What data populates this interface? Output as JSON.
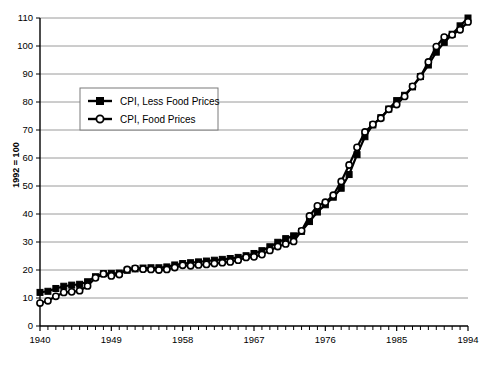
{
  "chart_data": {
    "type": "line",
    "title": "",
    "subtitle": "",
    "xlabel": "",
    "ylabel": "1992 = 100",
    "xlim": [
      1940,
      1994
    ],
    "ylim": [
      0,
      110
    ],
    "ytick_step": 10,
    "grid": true,
    "grid_axis": "y",
    "legend_position": "upper-left-inside",
    "xticks_major": [
      "1940",
      "1949",
      "1958",
      "1967",
      "1976",
      "1985",
      "1994"
    ],
    "xticks_major_values": [
      1940,
      1949,
      1958,
      1967,
      1976,
      1985,
      1994
    ],
    "xticks_minor_interval": 1,
    "yticks": [
      "0",
      "10",
      "20",
      "30",
      "40",
      "50",
      "60",
      "70",
      "80",
      "90",
      "100",
      "110"
    ],
    "ytick_values": [
      0,
      10,
      20,
      30,
      40,
      50,
      60,
      70,
      80,
      90,
      100,
      110
    ],
    "x": [
      1940,
      1941,
      1942,
      1943,
      1944,
      1945,
      1946,
      1947,
      1948,
      1949,
      1950,
      1951,
      1952,
      1953,
      1954,
      1955,
      1956,
      1957,
      1958,
      1959,
      1960,
      1961,
      1962,
      1963,
      1964,
      1965,
      1966,
      1967,
      1968,
      1969,
      1970,
      1971,
      1972,
      1973,
      1974,
      1975,
      1976,
      1977,
      1978,
      1979,
      1980,
      1981,
      1982,
      1983,
      1984,
      1985,
      1986,
      1987,
      1988,
      1989,
      1990,
      1991,
      1992,
      1993,
      1994
    ],
    "series": [
      {
        "name": "CPI, Less Food Prices",
        "marker": "filled-square",
        "color": "#000000",
        "values": [
          12.0,
          12.4,
          13.4,
          14.2,
          14.6,
          14.9,
          15.8,
          17.6,
          18.7,
          18.8,
          18.9,
          19.9,
          20.4,
          20.7,
          20.8,
          20.8,
          21.1,
          21.8,
          22.3,
          22.6,
          22.9,
          23.2,
          23.5,
          23.8,
          24.1,
          24.5,
          25.1,
          25.9,
          26.9,
          28.3,
          29.9,
          31.2,
          32.2,
          33.8,
          37.3,
          40.7,
          43.3,
          46.0,
          49.2,
          54.1,
          61.2,
          67.6,
          71.8,
          74.4,
          77.5,
          80.5,
          82.4,
          85.4,
          89.1,
          93.2,
          97.8,
          101.3,
          104.2,
          107.2,
          110.0
        ]
      },
      {
        "name": "CPI, Food Prices",
        "marker": "open-circle",
        "color": "#000000",
        "values": [
          8.2,
          9.0,
          10.6,
          12.0,
          12.2,
          12.6,
          14.3,
          17.2,
          18.6,
          17.9,
          18.4,
          20.2,
          20.6,
          20.3,
          20.2,
          20.0,
          20.2,
          20.9,
          21.7,
          21.5,
          21.8,
          22.0,
          22.3,
          22.6,
          22.9,
          23.5,
          24.5,
          24.7,
          25.5,
          27.0,
          28.4,
          29.3,
          30.2,
          34.0,
          39.3,
          42.9,
          44.2,
          46.7,
          51.6,
          57.5,
          63.8,
          69.3,
          72.0,
          74.2,
          77.4,
          79.1,
          82.0,
          85.6,
          89.1,
          94.3,
          99.8,
          103.2,
          104.0,
          105.8,
          108.6
        ]
      }
    ]
  },
  "legend": {
    "entries": [
      {
        "label": "CPI, Less Food Prices",
        "marker": "filled-square"
      },
      {
        "label": "CPI, Food Prices",
        "marker": "open-circle"
      }
    ]
  },
  "axis": {
    "y_axis_title": "1992 = 100"
  }
}
